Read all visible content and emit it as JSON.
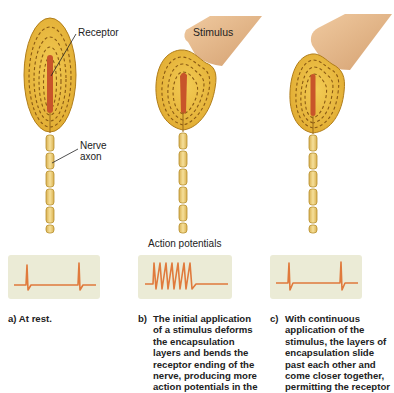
{
  "labels": {
    "receptor": "Receptor",
    "nerve_axon_line1": "Nerve",
    "nerve_axon_line2": "axon",
    "stimulus": "Stimulus",
    "action_potentials": "Action potentials"
  },
  "panels": [
    {
      "id": "a",
      "tag": "a)",
      "caption": "At rest.",
      "spike_count": 2
    },
    {
      "id": "b",
      "tag": "b)",
      "caption_lines": [
        "The initial application",
        "of a stimulus deforms",
        "the encapsulation",
        "layers and bends the",
        "receptor ending of the",
        "nerve, producing more",
        "action potentials in the"
      ],
      "spike_count": 7
    },
    {
      "id": "c",
      "tag": "c)",
      "caption_lines": [
        "With continuous",
        "application of the",
        "stimulus, the layers of",
        "encapsulation slide",
        "past each other and",
        "come closer together,",
        "permitting the receptor"
      ],
      "spike_count": 2
    }
  ],
  "colors": {
    "capsule_fill": "#e8b83a",
    "capsule_stroke": "#b07d1a",
    "layer_dash": "#8a5a14",
    "receptor_core": "#c8552a",
    "axon_fill": "#efd27a",
    "stimulus_fill": "#e2b07c",
    "trace_bg": "#ebebd6",
    "trace_line": "#e07a3c"
  }
}
